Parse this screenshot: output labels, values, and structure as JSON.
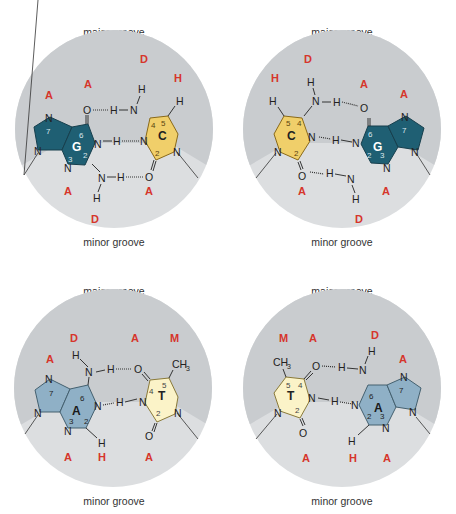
{
  "figure": {
    "colors": {
      "disc_upper": "#c9cccf",
      "disc_lower": "#dcdee0",
      "guanine": "#1f5f73",
      "cytosine": "#f0cf6a",
      "adenine": "#8fb0c6",
      "thymine": "#fbf3c8",
      "groove_code": "#d6352b"
    }
  },
  "panels": [
    {
      "id": "GC",
      "major_label": "major groove",
      "minor_label": "minor groove",
      "left_base": {
        "name": "G",
        "numbers": [
          "7",
          "6",
          "3",
          "2"
        ]
      },
      "right_base": {
        "name": "C",
        "numbers": [
          "4",
          "5",
          "2"
        ]
      },
      "major_codes": [
        "A",
        "A",
        "D",
        "H"
      ],
      "minor_codes": [
        "A",
        "D",
        "A"
      ]
    },
    {
      "id": "CG",
      "major_label": "major groove",
      "minor_label": "minor groove",
      "left_base": {
        "name": "C",
        "numbers": [
          "5",
          "4",
          "2"
        ]
      },
      "right_base": {
        "name": "G",
        "numbers": [
          "6",
          "7",
          "2",
          "3"
        ]
      },
      "major_codes": [
        "H",
        "D",
        "A",
        "A"
      ],
      "minor_codes": [
        "A",
        "D",
        "A"
      ]
    },
    {
      "id": "AT",
      "major_label": "major groove",
      "minor_label": "minor groove",
      "left_base": {
        "name": "A",
        "numbers": [
          "7",
          "6",
          "3",
          "2"
        ]
      },
      "right_base": {
        "name": "T",
        "numbers": [
          "4",
          "5",
          "2"
        ]
      },
      "major_codes": [
        "A",
        "D",
        "A",
        "M"
      ],
      "minor_codes": [
        "A",
        "H",
        "A"
      ]
    },
    {
      "id": "TA",
      "major_label": "major groove",
      "minor_label": "minor groove",
      "left_base": {
        "name": "T",
        "numbers": [
          "5",
          "4",
          "2"
        ]
      },
      "right_base": {
        "name": "A",
        "numbers": [
          "6",
          "7",
          "2",
          "3"
        ]
      },
      "major_codes": [
        "M",
        "A",
        "D",
        "A"
      ],
      "minor_codes": [
        "A",
        "H",
        "A"
      ]
    }
  ],
  "atoms": {
    "N": "N",
    "H": "H",
    "O": "O",
    "CH3": "CH",
    "sub3": "3"
  }
}
